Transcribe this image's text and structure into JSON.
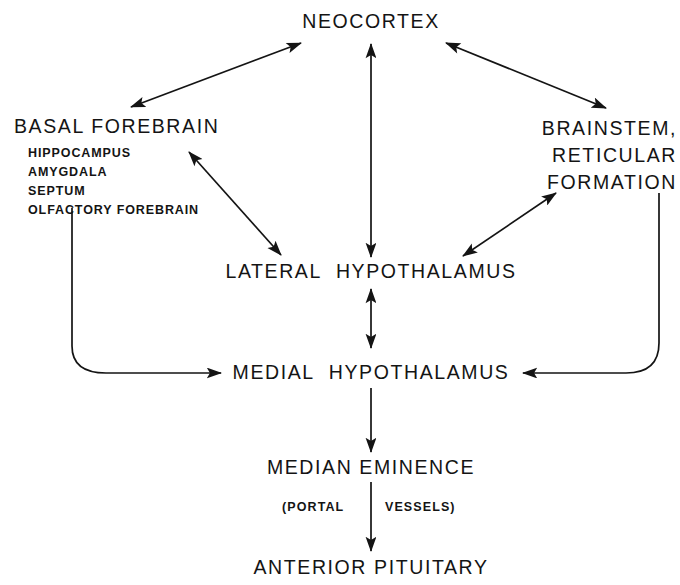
{
  "figure": {
    "kind": "flow-diagram",
    "background": "#ffffff",
    "ink": "#141414"
  },
  "nodes": {
    "neocortex": {
      "label": "NEOCORTEX"
    },
    "basal_forebrain": {
      "title": "BASAL FOREBRAIN",
      "items": [
        "HIPPOCAMPUS",
        "AMYGDALA",
        "SEPTUM",
        "OLFACTORY FOREBRAIN"
      ]
    },
    "brainstem": {
      "line1": "BRAINSTEM,",
      "line2": "RETICULAR",
      "line3": "FORMATION"
    },
    "lateral_hypothalamus": {
      "word1": "LATERAL",
      "word2": "HYPOTHALAMUS"
    },
    "medial_hypothalamus": {
      "word1": "MEDIAL",
      "word2": "HYPOTHALAMUS"
    },
    "median_eminence": {
      "label": "MEDIAN EMINENCE"
    },
    "portal_vessels": {
      "left": "(PORTAL",
      "right": "VESSELS)"
    },
    "anterior_pituitary": {
      "label": "ANTERIOR PITUITARY"
    }
  },
  "edges": [
    {
      "name": "neocortex-basal-forebrain",
      "style": "double",
      "shape": "line"
    },
    {
      "name": "neocortex-brainstem",
      "style": "double",
      "shape": "line"
    },
    {
      "name": "neocortex-lateral-hypothalamus",
      "style": "double",
      "shape": "line"
    },
    {
      "name": "basal-forebrain-lateral-hypothalamus",
      "style": "double",
      "shape": "line"
    },
    {
      "name": "brainstem-lateral-hypothalamus",
      "style": "double",
      "shape": "line"
    },
    {
      "name": "lateral-medial-hypothalamus",
      "style": "double",
      "shape": "line"
    },
    {
      "name": "basal-forebrain-medial-hypothalamus",
      "style": "single",
      "shape": "curve"
    },
    {
      "name": "medial-hypothalamus-brainstem",
      "style": "single",
      "shape": "curve"
    },
    {
      "name": "medial-hypothalamus-median-eminence",
      "style": "single",
      "shape": "line"
    },
    {
      "name": "median-eminence-anterior-pituitary",
      "style": "single",
      "shape": "line"
    }
  ]
}
